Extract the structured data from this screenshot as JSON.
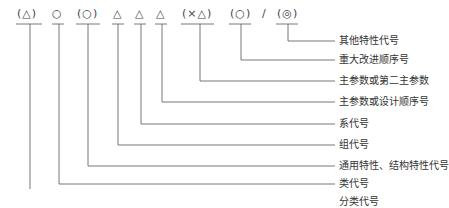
{
  "diagram": {
    "symbols": [
      {
        "text": "(△)"
      },
      {
        "text": "○"
      },
      {
        "text": "(○)"
      },
      {
        "text": "△"
      },
      {
        "text": "△"
      },
      {
        "text": "△"
      },
      {
        "text": "(×△)"
      },
      {
        "text": "(○)"
      },
      {
        "text": "/"
      },
      {
        "text": "(◎)"
      }
    ],
    "labels": [
      {
        "text": "其他特性代号"
      },
      {
        "text": "重大改进顺序号"
      },
      {
        "text": "主参数或第二主参数"
      },
      {
        "text": "主参数或设计顺序号"
      },
      {
        "text": "系代号"
      },
      {
        "text": "组代号"
      },
      {
        "text": "通用特性、结构特性代号"
      },
      {
        "text": "类代号"
      },
      {
        "text": "分类代号"
      }
    ]
  }
}
